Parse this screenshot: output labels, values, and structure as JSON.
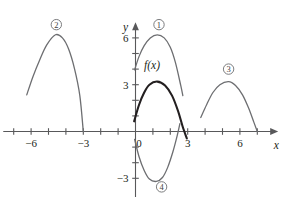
{
  "figure": {
    "axis_color": "#58585a",
    "curve_color": "#6d6e71",
    "emphasis_color": "#231f20",
    "background": "#ffffff"
  },
  "axes": {
    "x_label": "x",
    "y_label": "y",
    "origin_label": "0",
    "x_range": [
      -7.6,
      8.2
    ],
    "y_range": [
      -4.2,
      7.0
    ],
    "x_tick_labels": [
      {
        "value": -6,
        "text": "−6"
      },
      {
        "value": -3,
        "text": "−3"
      },
      {
        "value": 3,
        "text": "3"
      },
      {
        "value": 6,
        "text": "6"
      }
    ],
    "y_tick_labels": [
      {
        "value": 3,
        "text": "3"
      },
      {
        "value": 6,
        "text": "6"
      },
      {
        "value": -3,
        "text": "−3"
      }
    ],
    "x_ticks": [
      -7,
      -6,
      -5,
      -4,
      -3,
      -2,
      -1,
      1,
      2,
      3,
      4,
      5,
      6,
      7
    ],
    "y_ticks": [
      1,
      2,
      3,
      4,
      5,
      6,
      -1,
      -2,
      -3
    ]
  },
  "function_label": "f(x)",
  "markers": [
    {
      "id": "marker-1",
      "text": "①",
      "label": "1",
      "x": 1.35,
      "y": 6.85
    },
    {
      "id": "marker-2",
      "text": "②",
      "label": "2",
      "x": -4.55,
      "y": 6.85
    },
    {
      "id": "marker-3",
      "text": "③",
      "label": "3",
      "x": 5.35,
      "y": 4.0
    },
    {
      "id": "marker-4",
      "text": "④",
      "label": "4",
      "x": 1.5,
      "y": -3.55
    }
  ],
  "chart_data": {
    "type": "line",
    "xlabel": "x",
    "ylabel": "y",
    "xlim": [
      -7.6,
      8.2
    ],
    "ylim": [
      -4.2,
      7.0
    ],
    "grid": false,
    "legend": "none",
    "x_ticks": [
      -7,
      -6,
      -5,
      -4,
      -3,
      -2,
      -1,
      0,
      1,
      2,
      3,
      4,
      5,
      6,
      7
    ],
    "y_ticks": [
      -3,
      -2,
      -1,
      0,
      1,
      2,
      3,
      4,
      5,
      6
    ],
    "series": [
      {
        "name": "f(x)",
        "style": "emphasized",
        "form": "downward parabola",
        "vertex": [
          1.25,
          3.2
        ],
        "x_intercepts": [
          -0.15,
          2.65
        ],
        "domain": [
          -0.1,
          3.0
        ],
        "points": [
          [
            -0.08,
            0.65
          ],
          [
            0.2,
            1.7
          ],
          [
            0.5,
            2.5
          ],
          [
            0.8,
            3.0
          ],
          [
            1.25,
            3.2
          ],
          [
            1.7,
            2.95
          ],
          [
            2.1,
            2.3
          ],
          [
            2.45,
            1.3
          ],
          [
            2.7,
            0.35
          ],
          [
            2.95,
            -0.45
          ]
        ]
      },
      {
        "name": "curve 1",
        "style": "thin",
        "form": "downward parabola, f(x) shifted up 3",
        "vertex": [
          1.25,
          6.2
        ],
        "domain": [
          -0.1,
          2.65
        ],
        "points": [
          [
            -0.05,
            3.95
          ],
          [
            0.2,
            4.8
          ],
          [
            0.5,
            5.5
          ],
          [
            0.85,
            6.0
          ],
          [
            1.25,
            6.2
          ],
          [
            1.65,
            6.0
          ],
          [
            2.0,
            5.4
          ],
          [
            2.3,
            4.4
          ],
          [
            2.6,
            2.95
          ],
          [
            2.72,
            2.3
          ]
        ]
      },
      {
        "name": "curve 2",
        "style": "thin",
        "form": "downward parabola, f(x) shifted left ~6",
        "vertex": [
          -4.6,
          6.2
        ],
        "domain": [
          -6.25,
          -3.0
        ],
        "points": [
          [
            -6.25,
            2.35
          ],
          [
            -5.9,
            3.5
          ],
          [
            -5.5,
            4.6
          ],
          [
            -5.1,
            5.55
          ],
          [
            -4.6,
            6.2
          ],
          [
            -4.2,
            6.0
          ],
          [
            -3.85,
            5.3
          ],
          [
            -3.5,
            4.0
          ],
          [
            -3.2,
            2.3
          ],
          [
            -3.0,
            0.0
          ]
        ]
      },
      {
        "name": "curve 3",
        "style": "thin",
        "form": "downward parabola, f(x) shifted right ~4",
        "vertex": [
          5.35,
          3.2
        ],
        "domain": [
          3.75,
          7.0
        ],
        "points": [
          [
            3.75,
            0.9
          ],
          [
            4.1,
            1.75
          ],
          [
            4.45,
            2.5
          ],
          [
            4.85,
            3.0
          ],
          [
            5.35,
            3.2
          ],
          [
            5.75,
            2.95
          ],
          [
            6.15,
            2.35
          ],
          [
            6.5,
            1.5
          ],
          [
            6.8,
            0.6
          ],
          [
            7.0,
            0.0
          ]
        ]
      },
      {
        "name": "curve 4",
        "style": "thin",
        "form": "upward parabola, f(x) reflected in x-axis",
        "vertex": [
          1.2,
          -3.2
        ],
        "domain": [
          -0.05,
          2.5
        ],
        "points": [
          [
            -0.05,
            -0.5
          ],
          [
            0.2,
            -1.6
          ],
          [
            0.5,
            -2.5
          ],
          [
            0.8,
            -3.05
          ],
          [
            1.2,
            -3.2
          ],
          [
            1.55,
            -2.95
          ],
          [
            1.85,
            -2.3
          ],
          [
            2.15,
            -1.3
          ],
          [
            2.4,
            -0.25
          ],
          [
            2.55,
            0.5
          ]
        ]
      }
    ]
  }
}
